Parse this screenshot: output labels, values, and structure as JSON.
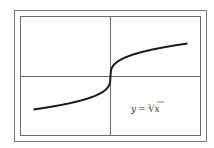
{
  "chart_data": {
    "type": "line",
    "title": "",
    "xlabel": "",
    "ylabel": "",
    "grid": false,
    "legend": [],
    "annotations": [
      "y = ∛x"
    ],
    "xlim": [
      -8,
      8
    ],
    "ylim": [
      -3,
      3
    ],
    "series": [
      {
        "name": "y = ∛x",
        "x": [
          -8,
          -6,
          -4,
          -2,
          -1,
          -0.5,
          -0.1,
          -0.01,
          0,
          0.01,
          0.1,
          0.5,
          1,
          2,
          4,
          6,
          8
        ],
        "y": [
          -2,
          -1.817,
          -1.587,
          -1.26,
          -1,
          -0.794,
          -0.464,
          -0.215,
          0,
          0.215,
          0.464,
          0.794,
          1,
          1.26,
          1.587,
          1.817,
          2
        ]
      }
    ]
  },
  "label": {
    "lhs": "y",
    "eq": "=",
    "index": "3",
    "radicand": "x"
  },
  "colors": {
    "frame": "#707070",
    "axis": "#404040",
    "curve": "#1a1a1a",
    "text": "#333333"
  }
}
